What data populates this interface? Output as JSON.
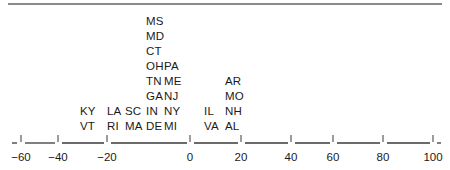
{
  "chart_data": {
    "type": "dot-stack",
    "title": "",
    "xlabel": "",
    "ylabel": "",
    "xlim": [
      -60,
      100
    ],
    "grid": false,
    "ticks": [
      -60,
      -40,
      -20,
      0,
      20,
      40,
      60,
      80,
      100
    ],
    "tick_labels": [
      "−60",
      "−40",
      "−20",
      "0",
      "20",
      "40",
      "60",
      "80",
      "100"
    ],
    "columns": [
      {
        "x_px": 80,
        "labels": [
          "VT",
          "KY"
        ]
      },
      {
        "x_px": 107,
        "labels": [
          "RI",
          "LA"
        ]
      },
      {
        "x_px": 125,
        "labels": [
          "MA",
          "SC"
        ]
      },
      {
        "x_px": 146,
        "labels": [
          "DE",
          "IN",
          "GA",
          "TN",
          "OH",
          "CT",
          "MD",
          "MS"
        ]
      },
      {
        "x_px": 164,
        "labels": [
          "MI",
          "NY",
          "NJ",
          "ME",
          "PA"
        ]
      },
      {
        "x_px": 204,
        "labels": [
          "VA",
          "IL"
        ]
      },
      {
        "x_px": 225,
        "labels": [
          "AL",
          "NH",
          "MO",
          "AR"
        ]
      }
    ]
  },
  "axis": {
    "tick_px": [
      21,
      58,
      107,
      190,
      241,
      291,
      333,
      383,
      433
    ]
  }
}
